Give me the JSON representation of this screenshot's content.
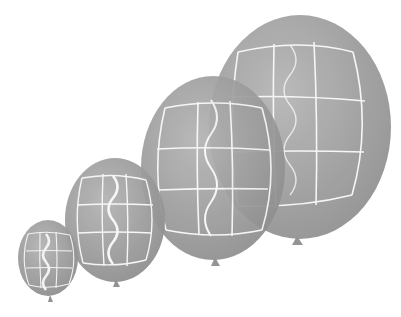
{
  "scene": {
    "description": "Four grey balloons of increasing size with white grid and wavy line patterns",
    "background": "#ffffff",
    "balloon_color": "#9a9a9a",
    "pattern_color": "#f4f4f4"
  },
  "balloons": [
    {
      "id": "balloon-small",
      "cx": 48,
      "cy": 258,
      "rx": 30,
      "ry": 38
    },
    {
      "id": "balloon-medium",
      "cx": 115,
      "cy": 220,
      "rx": 50,
      "ry": 62
    },
    {
      "id": "balloon-large",
      "cx": 213,
      "cy": 168,
      "rx": 72,
      "ry": 92
    },
    {
      "id": "balloon-xlarge",
      "cx": 300,
      "cy": 127,
      "rx": 91,
      "ry": 112
    }
  ]
}
